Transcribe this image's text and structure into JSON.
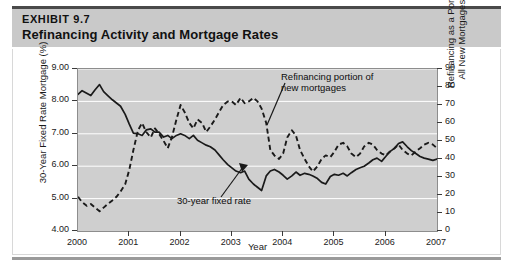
{
  "header": {
    "exhibit_label": "EXHIBIT 9.7",
    "title": "Refinancing Activity and Mortgage Rates",
    "band_color": "#c9c9c9"
  },
  "colors": {
    "plot_background": "#cfcfcf",
    "gridline": "#ffffff",
    "solid_series": "#1a1a1a",
    "dashed_series": "#1a1a1a",
    "axis": "#3a3a3a",
    "card_background": "#ffffff"
  },
  "chart_data": {
    "type": "line",
    "title": "Refinancing Activity and Mortgage Rates",
    "xlabel": "Year",
    "ylabel": "30-Year Fixed Rate Mortgage (%)",
    "y2label": "Refinancing as a Portion of All New Mortgages (%)",
    "grid": true,
    "legend": "annotations",
    "xlim": [
      2000.0,
      2007.0
    ],
    "ylim": [
      4.0,
      9.0
    ],
    "y2lim": [
      0,
      90
    ],
    "xticks": [
      "2000",
      "2001",
      "2002",
      "2003",
      "2004",
      "2005",
      "2006",
      "2007"
    ],
    "xtick_values": [
      2000,
      2001,
      2002,
      2003,
      2004,
      2005,
      2006,
      2007
    ],
    "yticks_left": [
      "9.00",
      "8.00",
      "7.00",
      "6.00",
      "5.00",
      "4.00"
    ],
    "ytick_left_values": [
      9.0,
      8.0,
      7.0,
      6.0,
      5.0,
      4.0
    ],
    "yticks_right": [
      "90",
      "80",
      "70",
      "60",
      "50",
      "40",
      "30",
      "20",
      "10",
      "0"
    ],
    "ytick_right_values": [
      90,
      80,
      70,
      60,
      50,
      40,
      30,
      20,
      10,
      0
    ],
    "annotations": [
      {
        "text": "Refinancing portion of\nnew mortgages",
        "target_series": "refinancing-portion"
      },
      {
        "text": "30-year fixed rate",
        "target_series": "fixed-rate"
      }
    ],
    "series": [
      {
        "name": "30-Year Fixed Rate Mortgage",
        "id": "fixed-rate",
        "style": "solid",
        "axis": "left",
        "x": [
          2000.0,
          2000.08,
          2000.17,
          2000.25,
          2000.33,
          2000.42,
          2000.5,
          2000.58,
          2000.67,
          2000.75,
          2000.83,
          2000.92,
          2001.0,
          2001.08,
          2001.17,
          2001.25,
          2001.33,
          2001.42,
          2001.5,
          2001.58,
          2001.67,
          2001.75,
          2001.83,
          2001.92,
          2002.0,
          2002.08,
          2002.17,
          2002.25,
          2002.33,
          2002.42,
          2002.5,
          2002.58,
          2002.67,
          2002.75,
          2002.83,
          2002.92,
          2003.0,
          2003.08,
          2003.17,
          2003.25,
          2003.33,
          2003.42,
          2003.5,
          2003.58,
          2003.67,
          2003.75,
          2003.83,
          2003.92,
          2004.0,
          2004.08,
          2004.17,
          2004.25,
          2004.33,
          2004.42,
          2004.5,
          2004.58,
          2004.67,
          2004.75,
          2004.83,
          2004.92,
          2005.0,
          2005.08,
          2005.17,
          2005.25,
          2005.33,
          2005.42,
          2005.5,
          2005.58,
          2005.67,
          2005.75,
          2005.83,
          2005.92,
          2006.0,
          2006.08,
          2006.17,
          2006.25,
          2006.33,
          2006.42,
          2006.5,
          2006.58,
          2006.67,
          2006.75,
          2006.83,
          2006.92,
          2007.0
        ],
        "y": [
          8.22,
          8.33,
          8.25,
          8.18,
          8.35,
          8.52,
          8.3,
          8.18,
          8.05,
          7.95,
          7.85,
          7.6,
          7.3,
          7.02,
          7.0,
          6.95,
          7.12,
          7.15,
          7.05,
          7.05,
          6.9,
          6.95,
          6.85,
          6.95,
          7.0,
          6.95,
          6.85,
          6.95,
          6.8,
          6.72,
          6.65,
          6.6,
          6.5,
          6.35,
          6.2,
          6.05,
          5.95,
          5.85,
          5.8,
          5.85,
          5.6,
          5.45,
          5.35,
          5.25,
          5.7,
          5.85,
          5.9,
          5.82,
          5.72,
          5.6,
          5.7,
          5.82,
          5.72,
          5.78,
          5.75,
          5.7,
          5.62,
          5.5,
          5.45,
          5.68,
          5.75,
          5.72,
          5.78,
          5.7,
          5.8,
          5.9,
          5.95,
          6.0,
          6.1,
          6.2,
          6.25,
          6.15,
          6.3,
          6.45,
          6.55,
          6.7,
          6.75,
          6.6,
          6.48,
          6.4,
          6.3,
          6.25,
          6.22,
          6.18,
          6.22
        ]
      },
      {
        "name": "Refinancing as a Portion of All New Mortgages",
        "id": "refinancing-portion",
        "style": "dashed",
        "axis": "right",
        "x": [
          2000.0,
          2000.08,
          2000.17,
          2000.25,
          2000.33,
          2000.42,
          2000.5,
          2000.58,
          2000.67,
          2000.75,
          2000.83,
          2000.92,
          2001.0,
          2001.08,
          2001.17,
          2001.25,
          2001.33,
          2001.42,
          2001.5,
          2001.58,
          2001.67,
          2001.75,
          2001.83,
          2001.92,
          2002.0,
          2002.08,
          2002.17,
          2002.25,
          2002.33,
          2002.42,
          2002.5,
          2002.58,
          2002.67,
          2002.75,
          2002.83,
          2002.92,
          2003.0,
          2003.08,
          2003.17,
          2003.25,
          2003.33,
          2003.42,
          2003.5,
          2003.58,
          2003.67,
          2003.75,
          2003.83,
          2003.92,
          2004.0,
          2004.08,
          2004.17,
          2004.25,
          2004.33,
          2004.42,
          2004.5,
          2004.58,
          2004.67,
          2004.75,
          2004.83,
          2004.92,
          2005.0,
          2005.08,
          2005.17,
          2005.25,
          2005.33,
          2005.42,
          2005.5,
          2005.58,
          2005.67,
          2005.75,
          2005.83,
          2005.92,
          2006.0,
          2006.08,
          2006.17,
          2006.25,
          2006.33,
          2006.42,
          2006.5,
          2006.58,
          2006.67,
          2006.75,
          2006.83,
          2006.92,
          2007.0
        ],
        "y": [
          19,
          16,
          14,
          15,
          13,
          11,
          13,
          15,
          17,
          19,
          22,
          26,
          34,
          45,
          56,
          60,
          55,
          52,
          57,
          54,
          50,
          46,
          52,
          62,
          70,
          66,
          60,
          57,
          62,
          60,
          55,
          58,
          62,
          66,
          70,
          72,
          72,
          70,
          74,
          71,
          72,
          74,
          72,
          68,
          60,
          45,
          42,
          40,
          43,
          52,
          56,
          53,
          45,
          40,
          36,
          33,
          36,
          40,
          42,
          41,
          44,
          48,
          49,
          47,
          43,
          41,
          43,
          47,
          49,
          48,
          45,
          43,
          42,
          44,
          46,
          48,
          45,
          43,
          42,
          44,
          46,
          48,
          49,
          48,
          46
        ]
      }
    ]
  }
}
